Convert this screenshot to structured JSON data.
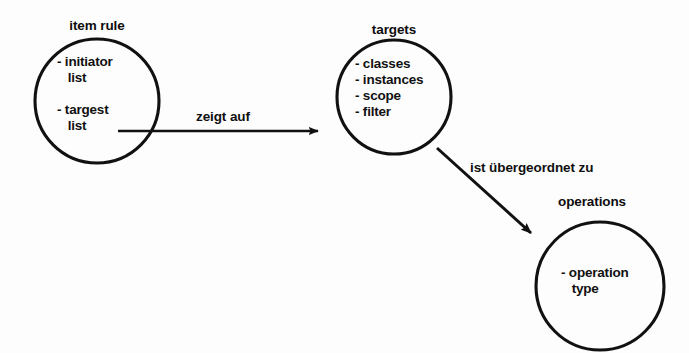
{
  "diagram": {
    "kind": "entity-relationship-bubble-diagram",
    "background_color": "#fdfdfd",
    "stroke_color": "#111111",
    "text_color": "#111111",
    "nodes": [
      {
        "id": "item-rule",
        "title": "item rule",
        "items": [
          "- initiator",
          "  list",
          "",
          "- targest",
          "  list"
        ],
        "items_text": "- initiator\n   list\n\n- targest\n   list",
        "cx": 97,
        "cy": 101,
        "r": 62
      },
      {
        "id": "targets",
        "title": "targets",
        "items": [
          "- classes",
          "- instances",
          "- scope",
          "- filter"
        ],
        "items_text": "- classes\n- instances\n- scope\n- filter",
        "cx": 394,
        "cy": 97,
        "r": 57
      },
      {
        "id": "operations",
        "title": "operations",
        "items": [
          "- operation",
          "  type"
        ],
        "items_text": "- operation\n   type",
        "cx": 600,
        "cy": 286,
        "r": 64
      }
    ],
    "edges": [
      {
        "id": "zeigt-auf",
        "label": "zeigt auf",
        "from": "item-rule",
        "to": "targets",
        "x1": 118,
        "y1": 131,
        "x2": 325,
        "y2": 131
      },
      {
        "id": "ist-uebergeordnet-zu",
        "label": "ist übergeordnet zu",
        "from": "targets",
        "to": "operations",
        "x1": 437,
        "y1": 148,
        "x2": 536,
        "y2": 238
      }
    ]
  }
}
